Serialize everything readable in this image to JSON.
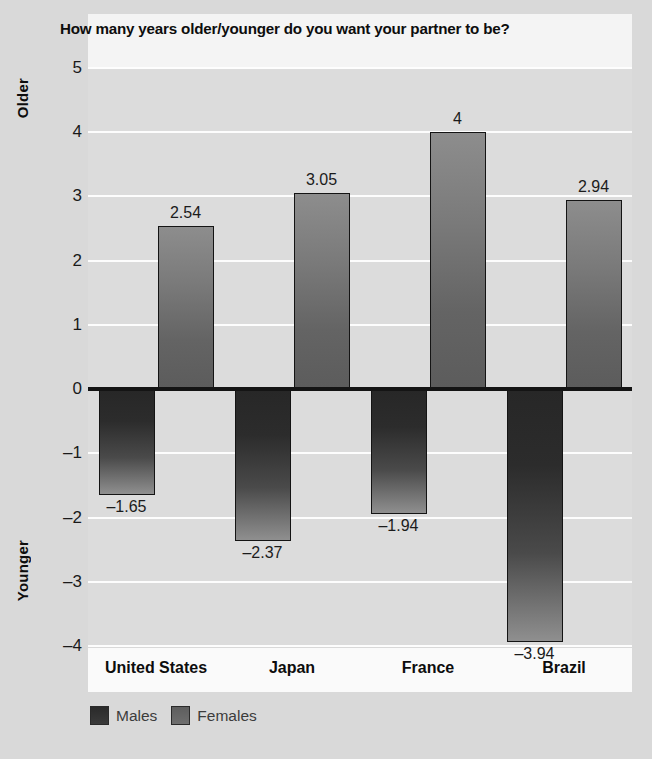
{
  "chart_data": {
    "type": "bar",
    "title": "How many years older/younger do you want your partner to be?",
    "xlabel": "",
    "ylabel": "",
    "axis_top_caption": "Older",
    "axis_bottom_caption": "Younger",
    "categories": [
      "United States",
      "Japan",
      "France",
      "Brazil"
    ],
    "series": [
      {
        "name": "Males",
        "color": "#2c2c2c",
        "values": [
          -1.65,
          -2.37,
          -1.94,
          -3.94
        ],
        "labels": [
          "–1.65",
          "–2.37",
          "–1.94",
          "–3.94"
        ]
      },
      {
        "name": "Females",
        "color": "#6e6e6e",
        "values": [
          2.54,
          3.05,
          4,
          2.94
        ],
        "labels": [
          "2.54",
          "3.05",
          "4",
          "2.94"
        ]
      }
    ],
    "ylim": [
      -4,
      5
    ],
    "yticks": [
      5,
      4,
      3,
      2,
      1,
      0,
      -1,
      -2,
      -3,
      -4
    ],
    "ytick_labels": [
      "5",
      "4",
      "3",
      "2",
      "1",
      "0",
      "–1",
      "–2",
      "–3",
      "–4"
    ],
    "grid": true,
    "legend_position": "bottom-left",
    "zero_line": true,
    "colors": {
      "page_background": "#d9d9d9",
      "plot_background": "#dcdcdc",
      "gridline": "#fdfdfd",
      "zero_line": "#141414",
      "title_band": "#f4f4f4",
      "category_band": "#fafafa",
      "text": "#1a1a1a"
    }
  },
  "legend": {
    "items": [
      {
        "label": "Males",
        "swatch": "male"
      },
      {
        "label": "Females",
        "swatch": "female"
      }
    ]
  }
}
